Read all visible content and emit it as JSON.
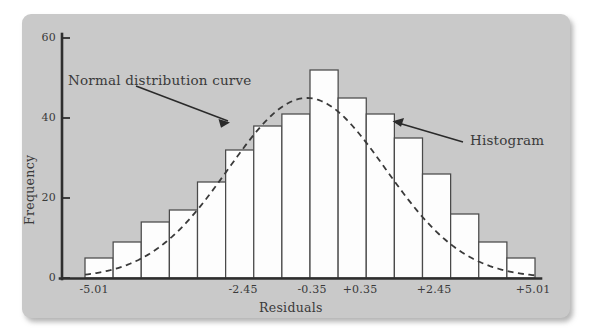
{
  "chart_data": {
    "type": "bar",
    "title": "",
    "subtitle": "",
    "xlabel": "Residuals",
    "ylabel": "Frequency",
    "ylim": [
      0,
      62
    ],
    "xlim": [
      -5.87,
      5.87
    ],
    "grid": false,
    "legend_position": "none",
    "y_ticks": [
      "0",
      "20",
      "40",
      "60"
    ],
    "y_tick_values": [
      0,
      20,
      40,
      60
    ],
    "x_ticks": [
      "-5.01",
      "-2.45",
      "-0.35",
      "+0.35",
      "+2.45",
      "+5.01"
    ],
    "x_tick_values": [
      -5.01,
      -2.45,
      -0.35,
      0.35,
      2.45,
      5.01
    ],
    "bin_width": 0.7,
    "bin_centers": [
      -5.36,
      -4.66,
      -3.96,
      -3.26,
      -2.56,
      -1.86,
      -1.16,
      -0.46,
      0.24,
      0.94,
      1.64,
      2.34,
      3.04,
      3.74,
      4.44,
      5.14
    ],
    "categories": [
      "-5.36",
      "-4.66",
      "-3.96",
      "-3.26",
      "-2.56",
      "-1.86",
      "-1.16",
      "-0.46",
      "0.24",
      "0.94",
      "1.64",
      "2.34",
      "3.04",
      "3.74",
      "4.44",
      "5.14"
    ],
    "values": [
      5,
      9,
      14,
      17,
      24,
      32,
      38,
      41,
      52,
      45,
      41,
      35,
      26,
      16,
      9,
      5
    ],
    "series": [
      {
        "name": "Histogram",
        "type": "bar",
        "values": [
          5,
          9,
          14,
          17,
          24,
          32,
          38,
          41,
          52,
          45,
          41,
          35,
          26,
          16,
          9,
          5
        ]
      },
      {
        "name": "Normal distribution curve",
        "type": "line",
        "style": "dashed",
        "mean": -0.08,
        "stdev": 2.05,
        "peak_value": 45
      }
    ],
    "annotations": [
      {
        "text": "Normal distribution curve",
        "target": "normal-curve"
      },
      {
        "text": "Histogram",
        "target": "histogram-bars"
      }
    ],
    "colors": {
      "panel_background": "#c9c9c9",
      "bar_fill": "#fdfdfd",
      "bar_stroke": "#4a4a4a",
      "axis": "#2e2e2e",
      "curve": "#3a3a3a",
      "text": "#3a3a3a"
    }
  }
}
